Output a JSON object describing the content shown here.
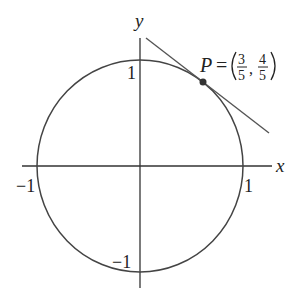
{
  "diagram": {
    "type": "unit-circle-tangent",
    "axes": {
      "x_label": "x",
      "y_label": "y"
    },
    "ticks": {
      "x_pos": "1",
      "x_neg": "−1",
      "y_pos": "1",
      "y_neg": "−1"
    },
    "point": {
      "name": "P",
      "equals": "=",
      "x_num": "3",
      "x_den": "5",
      "y_num": "4",
      "y_den": "5",
      "comma": ","
    },
    "colors": {
      "stroke": "#333333",
      "tangent": "#555555",
      "point": "#333333"
    }
  }
}
